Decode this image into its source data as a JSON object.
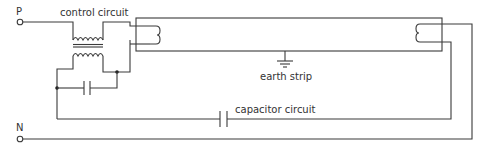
{
  "diagram": {
    "terminals": {
      "phase": "P",
      "neutral": "N"
    },
    "labels": {
      "control_circuit": "control circuit",
      "earth_strip": "earth strip",
      "capacitor_circuit": "capacitor circuit"
    },
    "components": [
      {
        "name": "transformer",
        "type": "inductor-pair"
      },
      {
        "name": "secondary-capacitor",
        "type": "capacitor"
      },
      {
        "name": "fluorescent-tube",
        "type": "tube"
      },
      {
        "name": "left-filament",
        "type": "filament"
      },
      {
        "name": "right-filament",
        "type": "filament"
      },
      {
        "name": "earth-strip",
        "type": "ground"
      },
      {
        "name": "power-factor-capacitor",
        "type": "capacitor"
      }
    ],
    "colors": {
      "line": "#3a3a3a",
      "text": "#333333",
      "background": "#ffffff"
    }
  }
}
